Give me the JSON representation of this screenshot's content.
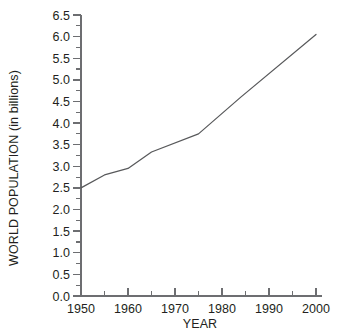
{
  "chart_data": {
    "type": "line",
    "title": "",
    "subtitle": "",
    "xlabel": "YEAR",
    "ylabel": "WORLD POPULATION (in billions)",
    "xlim": [
      1950,
      2000
    ],
    "ylim": [
      0.0,
      6.5
    ],
    "grid": false,
    "legend": null,
    "x_ticks": [
      1950,
      1960,
      1970,
      1980,
      1990,
      2000
    ],
    "x_tick_labels": [
      "1950",
      "1960",
      "1970",
      "1980",
      "1990",
      "2000"
    ],
    "x_minor_tick_step": 5,
    "y_ticks": [
      0.0,
      0.5,
      1.0,
      1.5,
      2.0,
      2.5,
      3.0,
      3.5,
      4.0,
      4.5,
      5.0,
      5.5,
      6.0,
      6.5
    ],
    "y_tick_labels": [
      "0.0",
      "0.5",
      "1.0",
      "1.5",
      "2.0",
      "2.5",
      "3.0",
      "3.5",
      "4.0",
      "4.5",
      "5.0",
      "5.5",
      "6.0",
      "6.5"
    ],
    "y_minor_tick_step": 0.25,
    "line_color": "#58595b",
    "axis_color": "#6d6e71",
    "text_color": "#231f20",
    "background_color": "#ffffff",
    "x": [
      1950,
      1955,
      1960,
      1965,
      1975,
      1984,
      2000
    ],
    "values": [
      2.5,
      2.8,
      2.95,
      3.33,
      3.75,
      4.6,
      6.05
    ],
    "series": [
      {
        "name": "World population",
        "x": [
          1950,
          1955,
          1960,
          1965,
          1975,
          1984,
          2000
        ],
        "values": [
          2.5,
          2.8,
          2.95,
          3.33,
          3.75,
          4.6,
          6.05
        ]
      }
    ]
  }
}
